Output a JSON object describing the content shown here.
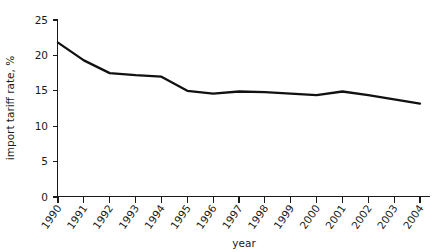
{
  "chart_data": {
    "type": "line",
    "title": "",
    "subtitle": "",
    "xlabel": "year",
    "ylabel": "import tariff rate, %",
    "grid": false,
    "legend": false,
    "legend_position": "none",
    "xlim": [
      1990,
      2004
    ],
    "ylim": [
      0,
      25
    ],
    "y_ticks": [
      0,
      5,
      10,
      15,
      20,
      25
    ],
    "y_tick_labels": [
      "0",
      "5",
      "10",
      "15",
      "20",
      "25"
    ],
    "x_ticks": [
      1990,
      1991,
      1992,
      1993,
      1994,
      1995,
      1996,
      1997,
      1998,
      1999,
      2000,
      2001,
      2002,
      2003,
      2004
    ],
    "categories": [
      "1990",
      "1991",
      "1992",
      "1993",
      "1994",
      "1995",
      "1996",
      "1997",
      "1998",
      "1999",
      "2000",
      "2001",
      "2002",
      "2003",
      "2004"
    ],
    "values": [
      21.8,
      19.3,
      17.5,
      17.2,
      17.0,
      15.0,
      14.6,
      14.9,
      14.8,
      14.6,
      14.4,
      14.9,
      14.4,
      13.8,
      13.2
    ],
    "series": [
      {
        "name": "import tariff rate",
        "color": "#111111",
        "values": [
          21.8,
          19.3,
          17.5,
          17.2,
          17.0,
          15.0,
          14.6,
          14.9,
          14.8,
          14.6,
          14.4,
          14.9,
          14.4,
          13.8,
          13.2
        ]
      }
    ],
    "annotations": []
  },
  "axes": {
    "y_axis_title": "import tariff rate, %",
    "x_axis_title": "year"
  },
  "colors": {
    "line": "#111111",
    "axis": "#1a1a1a",
    "background": "#ffffff",
    "text": "#1a1a1a"
  }
}
